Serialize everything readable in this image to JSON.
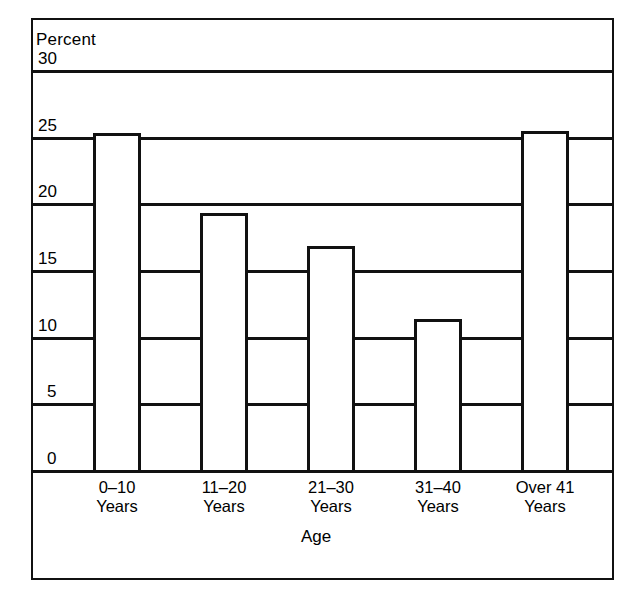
{
  "chart_data": {
    "type": "bar",
    "title": "",
    "ylabel": "Percent",
    "xlabel": "Age",
    "categories": [
      "0–10 Years",
      "11–20 Years",
      "21–30 Years",
      "31–40 Years",
      "Over 41 Years"
    ],
    "category_lines": [
      {
        "line1": "0–10",
        "line2": "Years"
      },
      {
        "line1": "11–20",
        "line2": "Years"
      },
      {
        "line1": "21–30",
        "line2": "Years"
      },
      {
        "line1": "31–40",
        "line2": "Years"
      },
      {
        "line1": "Over 41",
        "line2": "Years"
      }
    ],
    "values": [
      25.3,
      19.3,
      16.8,
      11.3,
      25.4
    ],
    "ylim": [
      0,
      30
    ],
    "ytick_labels": [
      "30",
      "25",
      "20",
      "15",
      "10",
      "5",
      "0"
    ],
    "ytick_values": [
      30,
      25,
      20,
      15,
      10,
      5,
      0
    ],
    "grid": true,
    "legend": "none",
    "bar_style": "outlined-hollow",
    "colors": {
      "line": "#111111",
      "bar_fill": "#ffffff",
      "background": "#ffffff"
    }
  }
}
